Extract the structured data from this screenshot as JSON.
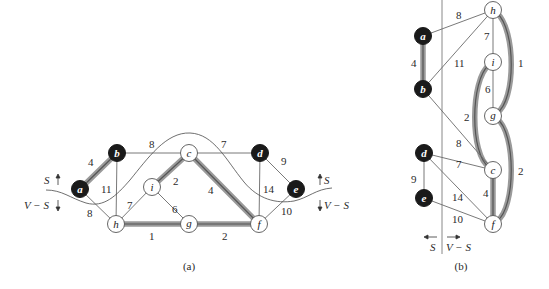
{
  "figure": {
    "panels": [
      {
        "id": "a",
        "caption": "(a)",
        "cut_labels": {
          "left_top": "S",
          "left_bottom": "V − S",
          "right_top": "S",
          "right_bottom": "V − S"
        },
        "nodes": [
          {
            "id": "a",
            "label": "a",
            "in_S": true,
            "x": 80,
            "y": 189
          },
          {
            "id": "b",
            "label": "b",
            "in_S": true,
            "x": 117,
            "y": 153
          },
          {
            "id": "c",
            "label": "c",
            "in_S": false,
            "x": 189,
            "y": 153
          },
          {
            "id": "d",
            "label": "d",
            "in_S": true,
            "x": 260,
            "y": 153
          },
          {
            "id": "e",
            "label": "e",
            "in_S": true,
            "x": 296,
            "y": 189
          },
          {
            "id": "f",
            "label": "f",
            "in_S": false,
            "x": 259,
            "y": 224
          },
          {
            "id": "g",
            "label": "g",
            "in_S": false,
            "x": 189,
            "y": 224
          },
          {
            "id": "h",
            "label": "h",
            "in_S": false,
            "x": 116,
            "y": 224
          },
          {
            "id": "i",
            "label": "i",
            "in_S": false,
            "x": 152,
            "y": 187
          }
        ],
        "edges": [
          {
            "from": "a",
            "to": "b",
            "weight": "4",
            "highlighted": true
          },
          {
            "from": "a",
            "to": "h",
            "weight": "8",
            "highlighted": false
          },
          {
            "from": "b",
            "to": "c",
            "weight": "8",
            "highlighted": false
          },
          {
            "from": "b",
            "to": "h",
            "weight": "11",
            "highlighted": false
          },
          {
            "from": "c",
            "to": "d",
            "weight": "7",
            "highlighted": false
          },
          {
            "from": "c",
            "to": "i",
            "weight": "2",
            "highlighted": true
          },
          {
            "from": "c",
            "to": "f",
            "weight": "4",
            "highlighted": true
          },
          {
            "from": "d",
            "to": "e",
            "weight": "9",
            "highlighted": false
          },
          {
            "from": "d",
            "to": "f",
            "weight": "14",
            "highlighted": false
          },
          {
            "from": "e",
            "to": "f",
            "weight": "10",
            "highlighted": false
          },
          {
            "from": "f",
            "to": "g",
            "weight": "2",
            "highlighted": true
          },
          {
            "from": "g",
            "to": "h",
            "weight": "1",
            "highlighted": true
          },
          {
            "from": "g",
            "to": "i",
            "weight": "6",
            "highlighted": false
          },
          {
            "from": "h",
            "to": "i",
            "weight": "7",
            "highlighted": false
          }
        ]
      },
      {
        "id": "b",
        "caption": "(b)",
        "cut_labels": {
          "left": "S",
          "right": "V − S"
        },
        "nodes": [
          {
            "id": "a",
            "label": "a",
            "in_S": true,
            "x": 423,
            "y": 36
          },
          {
            "id": "b",
            "label": "b",
            "in_S": true,
            "x": 423,
            "y": 89
          },
          {
            "id": "d",
            "label": "d",
            "in_S": true,
            "x": 424,
            "y": 153
          },
          {
            "id": "e",
            "label": "e",
            "in_S": true,
            "x": 424,
            "y": 198
          },
          {
            "id": "h",
            "label": "h",
            "in_S": false,
            "x": 493,
            "y": 10
          },
          {
            "id": "i",
            "label": "i",
            "in_S": false,
            "x": 493,
            "y": 62
          },
          {
            "id": "g",
            "label": "g",
            "in_S": false,
            "x": 493,
            "y": 116
          },
          {
            "id": "c",
            "label": "c",
            "in_S": false,
            "x": 493,
            "y": 170
          },
          {
            "id": "f",
            "label": "f",
            "in_S": false,
            "x": 493,
            "y": 224
          }
        ],
        "edges": [
          {
            "from": "a",
            "to": "b",
            "weight": "4",
            "highlighted": true
          },
          {
            "from": "a",
            "to": "h",
            "weight": "8",
            "highlighted": false
          },
          {
            "from": "b",
            "to": "h",
            "weight": "11",
            "highlighted": false
          },
          {
            "from": "b",
            "to": "c",
            "weight": "8",
            "highlighted": false
          },
          {
            "from": "h",
            "to": "i",
            "weight": "7",
            "highlighted": false
          },
          {
            "from": "h",
            "to": "g",
            "weight": "1",
            "highlighted": true
          },
          {
            "from": "i",
            "to": "g",
            "weight": "6",
            "highlighted": false
          },
          {
            "from": "i",
            "to": "c",
            "weight": "2",
            "highlighted": true
          },
          {
            "from": "g",
            "to": "f",
            "weight": "2",
            "highlighted": true
          },
          {
            "from": "d",
            "to": "c",
            "weight": "7",
            "highlighted": false
          },
          {
            "from": "d",
            "to": "e",
            "weight": "9",
            "highlighted": false
          },
          {
            "from": "d",
            "to": "f",
            "weight": "14",
            "highlighted": false
          },
          {
            "from": "c",
            "to": "f",
            "weight": "4",
            "highlighted": true
          },
          {
            "from": "e",
            "to": "f",
            "weight": "10",
            "highlighted": false
          }
        ]
      }
    ],
    "colors": {
      "node_in_S": "#1a1a1a",
      "node_outside": "#ffffff",
      "edge": "#6a6a6a",
      "highlight_outer": "#8f8f8f",
      "highlight_inner": "#5a5a5a",
      "cut_line": "#4a4a4a"
    }
  }
}
